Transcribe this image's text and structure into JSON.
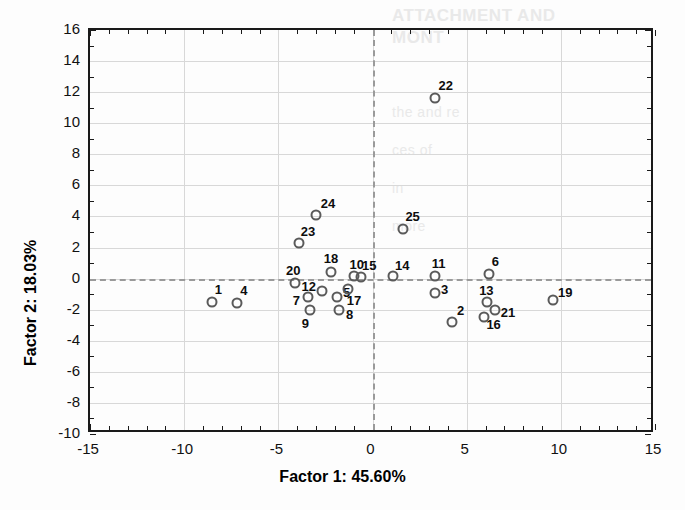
{
  "chart_data": {
    "type": "scatter",
    "title": "",
    "xlabel": "Factor 1: 45.60%",
    "ylabel": "Factor 2: 18.03%",
    "xlim": [
      -15,
      15
    ],
    "ylim": [
      -10,
      16
    ],
    "xticks": [
      -15,
      -10,
      -5,
      0,
      5,
      10,
      15
    ],
    "xticklabels": [
      "-15",
      "-10",
      "-5",
      "0",
      "5",
      "10",
      "15"
    ],
    "yticks": [
      -10,
      -8,
      -6,
      -4,
      -2,
      0,
      2,
      4,
      6,
      8,
      10,
      12,
      14,
      16
    ],
    "yticklabels": [
      "-10",
      "-8",
      "-6",
      "-4",
      "-2",
      "0",
      "2",
      "4",
      "6",
      "8",
      "10",
      "12",
      "14",
      "16"
    ],
    "xtick_minor_step": 1,
    "ytick_minor_step": 1,
    "grid": true,
    "grid_color": "#d8d8d8",
    "zero_lines": {
      "x": 0,
      "y": 0,
      "style": "dashed",
      "color": "#9a9a9a"
    },
    "legend": "none",
    "marker": {
      "shape": "circle",
      "filled": false,
      "edge_color": "#5a5a5a",
      "size_px": 11
    },
    "label_color": "#0d0d0d",
    "points": [
      {
        "label": "1",
        "x": -8.5,
        "y": -1.5,
        "label_dx": 6,
        "label_dy": -13
      },
      {
        "label": "2",
        "x": 4.2,
        "y": -2.8,
        "label_dx": 9,
        "label_dy": -12
      },
      {
        "label": "3",
        "x": 3.3,
        "y": -0.9,
        "label_dx": 10,
        "label_dy": -4
      },
      {
        "label": "4",
        "x": -7.2,
        "y": -1.6,
        "label_dx": 7,
        "label_dy": -13
      },
      {
        "label": "5",
        "x": -1.9,
        "y": -1.2,
        "label_dx": 10,
        "label_dy": -5
      },
      {
        "label": "6",
        "x": 6.2,
        "y": 0.3,
        "label_dx": 6,
        "label_dy": -13
      },
      {
        "label": "7",
        "x": -3.4,
        "y": -1.2,
        "label_dx": -12,
        "label_dy": 3
      },
      {
        "label": "8",
        "x": -1.8,
        "y": -2.0,
        "label_dx": 11,
        "label_dy": 4
      },
      {
        "label": "9",
        "x": -3.3,
        "y": -2.0,
        "label_dx": -5,
        "label_dy": 13
      },
      {
        "label": "10",
        "x": -1.0,
        "y": 0.2,
        "label_dx": 3,
        "label_dy": -12
      },
      {
        "label": "11",
        "x": 3.3,
        "y": 0.2,
        "label_dx": 4,
        "label_dy": -13
      },
      {
        "label": "12",
        "x": -2.7,
        "y": -0.8,
        "label_dx": -13,
        "label_dy": -5
      },
      {
        "label": "13",
        "x": 6.1,
        "y": -1.5,
        "label_dx": -1,
        "label_dy": -12
      },
      {
        "label": "14",
        "x": 1.1,
        "y": 0.2,
        "label_dx": 9,
        "label_dy": -11
      },
      {
        "label": "15",
        "x": -0.6,
        "y": 0.1,
        "label_dx": 8,
        "label_dy": -12
      },
      {
        "label": "16",
        "x": 5.9,
        "y": -2.5,
        "label_dx": 10,
        "label_dy": 7
      },
      {
        "label": "17",
        "x": -1.3,
        "y": -0.7,
        "label_dx": 6,
        "label_dy": 11
      },
      {
        "label": "18",
        "x": -2.2,
        "y": 0.4,
        "label_dx": 0,
        "label_dy": -14
      },
      {
        "label": "19",
        "x": 9.6,
        "y": -1.4,
        "label_dx": 12,
        "label_dy": -8
      },
      {
        "label": "20",
        "x": -4.1,
        "y": -0.3,
        "label_dx": -2,
        "label_dy": -13
      },
      {
        "label": "21",
        "x": 6.5,
        "y": -2.0,
        "label_dx": 13,
        "label_dy": 2
      },
      {
        "label": "22",
        "x": 3.3,
        "y": 11.6,
        "label_dx": 11,
        "label_dy": -13
      },
      {
        "label": "23",
        "x": -3.9,
        "y": 2.3,
        "label_dx": 9,
        "label_dy": -12
      },
      {
        "label": "24",
        "x": -3.0,
        "y": 4.1,
        "label_dx": 12,
        "label_dy": -12
      },
      {
        "label": "25",
        "x": 1.6,
        "y": 3.2,
        "label_dx": 10,
        "label_dy": -13
      }
    ]
  },
  "bleed_through": {
    "lines": [
      "ATTACHMENT AND",
      "MONT",
      "the and re",
      "ces of",
      "in",
      "more"
    ]
  }
}
